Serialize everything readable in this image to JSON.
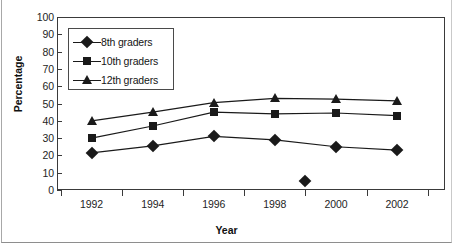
{
  "chart_data": {
    "type": "line",
    "title": "",
    "xlabel": "Year",
    "ylabel": "Percentage",
    "categories": [
      "1992",
      "1994",
      "1996",
      "1998",
      "2000",
      "2002"
    ],
    "x": [
      1992,
      1994,
      1996,
      1998,
      2000,
      2002
    ],
    "ylim": [
      0,
      100
    ],
    "y_ticks": [
      0,
      10,
      20,
      30,
      40,
      50,
      60,
      70,
      80,
      90,
      100
    ],
    "grid": false,
    "legend_position": "upper-left-inside",
    "series": [
      {
        "name": "8th graders",
        "marker": "diamond",
        "values": [
          21.5,
          25.5,
          31,
          29,
          25,
          23
        ]
      },
      {
        "name": "10th graders",
        "marker": "square",
        "values": [
          30,
          37,
          45,
          44,
          44.5,
          43
        ]
      },
      {
        "name": "12th graders",
        "marker": "triangle",
        "values": [
          40,
          45,
          50.5,
          53,
          52.5,
          51.5
        ]
      }
    ],
    "extra_points": [
      {
        "series": "8th graders",
        "marker": "diamond",
        "x": 1999,
        "y": 5,
        "connected": false
      }
    ],
    "colors": {
      "line": "#1a1a1a",
      "marker": "#1a1a1a",
      "axis": "#3a3a3a",
      "background": "#ffffff",
      "text": "#151515"
    }
  },
  "axes": {
    "y_title": "Percentage",
    "x_title": "Year",
    "y_tick_labels": [
      "100",
      "90",
      "80",
      "70",
      "60",
      "50",
      "40",
      "30",
      "20",
      "10",
      "0"
    ],
    "x_tick_labels": [
      "1992",
      "1994",
      "1996",
      "1998",
      "2000",
      "2002"
    ]
  },
  "legend": {
    "entries": [
      {
        "label": "8th graders",
        "marker": "diamond-marker"
      },
      {
        "label": "10th graders",
        "marker": "square-marker"
      },
      {
        "label": "12th graders",
        "marker": "triangle-marker"
      }
    ]
  }
}
